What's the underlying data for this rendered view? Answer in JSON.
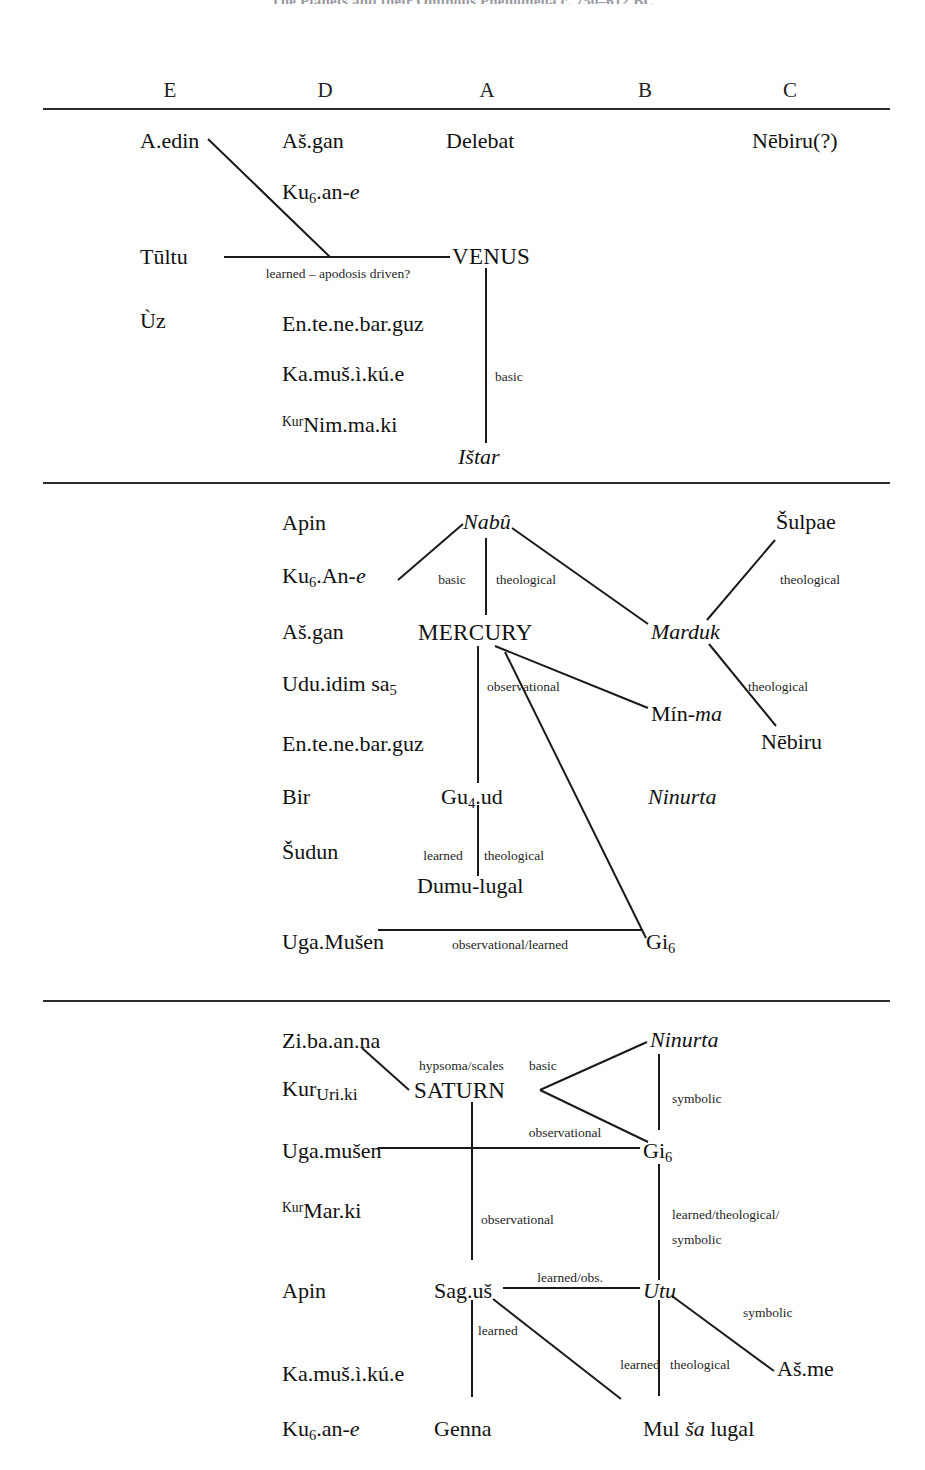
{
  "title": "The Planets and their Ominous Phenomena c. 750–612 BC",
  "columns": [
    {
      "label": "E"
    },
    {
      "label": "D"
    },
    {
      "label": "A"
    },
    {
      "label": "B"
    },
    {
      "label": "C"
    }
  ],
  "sections": [
    {
      "id": "venus",
      "planet": "VENUS",
      "nodes": {
        "a_edin": "A.edin",
        "as_gan": "Aš.gan",
        "delebat": "Delebat",
        "nebiru_q": "Nēbiru(?)",
        "ku6_an_e_pre": "Ku",
        "ku6_an_e_sub": "6",
        "ku6_an_e_post": ".an-",
        "ku6_an_e_ital": "e",
        "tultu": "Tūltu",
        "venus": "VENUS",
        "uz": "Ùz",
        "en_te_ne_bar_guz": "En.te.ne.bar.guz",
        "ka_mus_i_ku_e": "Ka.muš.ì.kú.e",
        "nim_ma_ki_det": "Kur",
        "nim_ma_ki": "Nim.ma.ki",
        "istar": "Ištar"
      },
      "edge_labels": {
        "learned_apodosis": "learned – apodosis driven?",
        "basic": "basic"
      }
    },
    {
      "id": "mercury",
      "planet": "MERCURY",
      "nodes": {
        "apin": "Apin",
        "nabu": "Nabû",
        "sulpae": "Šulpae",
        "ku6_an_e_pre": "Ku",
        "ku6_an_e_sub": "6",
        "ku6_an_e_post": ".An-",
        "ku6_an_e_ital": "e",
        "as_gan": "Aš.gan",
        "mercury": "MERCURY",
        "marduk": "Marduk",
        "udu_idim_pre": "Udu.idim sa",
        "udu_idim_sub": "5",
        "min_ma_pre": "Mín-",
        "min_ma_ital": "ma",
        "nebiru": "Nēbiru",
        "en_te_ne_bar_guz": "En.te.ne.bar.guz",
        "bir": "Bir",
        "gu4_ud_pre": "Gu",
        "gu4_ud_sub": "4",
        "gu4_ud_post": ".ud",
        "ninurta": "Ninurta",
        "sudun": "Šudun",
        "dumu_lugal": "Dumu-lugal",
        "uga_musen": "Uga.Mušen",
        "gi6_pre": "Gi",
        "gi6_sub": "6"
      },
      "edge_labels": {
        "basic": "basic",
        "theological_nabu": "theological",
        "theological_sulpae": "theological",
        "theological_nebiru": "theological",
        "observational": "observational",
        "learned": "learned",
        "theological_dumu": "theological",
        "observational_learned": "observational/learned"
      }
    },
    {
      "id": "saturn",
      "planet": "SATURN",
      "nodes": {
        "zi_ba_an_na": "Zi.ba.an.na",
        "ninurta": "Ninurta",
        "uri_ki_det": "Kur",
        "uri_ki": "Uri.ki",
        "saturn": "SATURN",
        "uga_musen": "Uga.mušen",
        "gi6_pre": "Gi",
        "gi6_sub": "6",
        "mar_ki_det": "Kur",
        "mar_ki": "Mar.ki",
        "apin": "Apin",
        "sag_us": "Sag.uš",
        "utu": "Utu",
        "as_me": "Aš.me",
        "ka_mus_i_ku_e": "Ka.muš.ì.kú.e",
        "ku6_an_e_pre": "Ku",
        "ku6_an_e_sub": "6",
        "ku6_an_e_post": ".an-",
        "ku6_an_e_ital": "e",
        "genna": "Genna",
        "mul_sa_lugal_pre": "Mul ",
        "mul_sa_lugal_ital": "ša",
        "mul_sa_lugal_post": " lugal"
      },
      "edge_labels": {
        "hypsoma_scales": "hypsoma/scales",
        "basic": "basic",
        "symbolic_ninurta": "symbolic",
        "observational_gi6": "observational",
        "observational_saturn": "observational",
        "learned_theological_symbolic_1": "learned/theological/",
        "learned_theological_symbolic_2": "symbolic",
        "learned_obs": "learned/obs.",
        "symbolic_asme": "symbolic",
        "learned_genna": "learned",
        "learned_mul": "learned",
        "theological_mul": "theological"
      }
    }
  ]
}
